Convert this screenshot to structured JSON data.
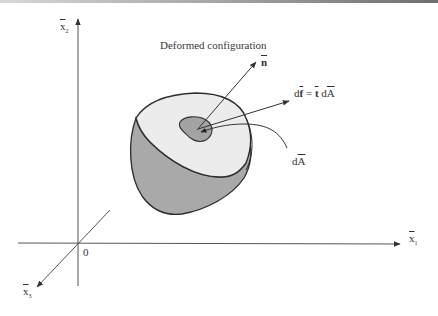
{
  "diagram": {
    "title": "Deformed configuration",
    "axes": {
      "x1": {
        "symbol": "x",
        "subscript": "1",
        "overbar": true
      },
      "x2": {
        "symbol": "x",
        "subscript": "2",
        "overbar": true
      },
      "x3": {
        "symbol": "x",
        "subscript": "3",
        "overbar": true
      },
      "origin": "0"
    },
    "vectors": {
      "normal": {
        "symbol": "n",
        "overbar": true
      },
      "force": {
        "d1": "d",
        "f": "f",
        "eq": " = ",
        "t": "t",
        "d2": " d",
        "A": "A"
      }
    },
    "area_element": {
      "d": "d",
      "A": "A"
    },
    "colors": {
      "line": "#333333",
      "top_face": "#ececec",
      "side_face": "#a9a9a9",
      "patch": "#a3a3a3"
    }
  }
}
